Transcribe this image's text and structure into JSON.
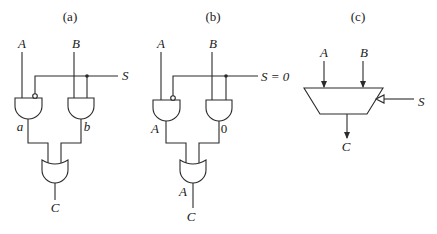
{
  "panels": [
    {
      "id": "a",
      "caption": "(a)",
      "inputs": {
        "a": "A",
        "b": "B",
        "select": "S"
      },
      "intermediate": {
        "left_gate_out": "a",
        "right_gate_out": "b"
      },
      "output": "C",
      "or_out_label": ""
    },
    {
      "id": "b",
      "caption": "(b)",
      "inputs": {
        "a": "A",
        "b": "B",
        "select": "S = 0"
      },
      "intermediate": {
        "left_gate_out": "A",
        "right_gate_out": "0"
      },
      "output": "C",
      "or_out_label": "A"
    },
    {
      "id": "c",
      "caption": "(c)",
      "inputs": {
        "a": "A",
        "b": "B",
        "select": "S"
      },
      "output": "C"
    }
  ],
  "colors": {
    "line": "#2a2a2a",
    "text": "#1a1a1a",
    "background": "#ffffff"
  }
}
